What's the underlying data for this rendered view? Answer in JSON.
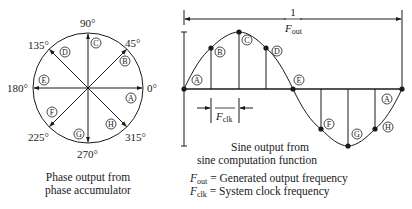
{
  "phase_wheel": {
    "angle_labels": {
      "deg0": "0°",
      "deg45": "45°",
      "deg90": "90°",
      "deg135": "135°",
      "deg180": "180°",
      "deg225": "225°",
      "deg270": "270°",
      "deg315": "315°"
    },
    "point_labels": [
      "A",
      "B",
      "C",
      "D",
      "E",
      "F",
      "G",
      "H"
    ],
    "caption_line1": "Phase output from",
    "caption_line2": "phase accumulator"
  },
  "sine_wave": {
    "period_numerator": "1",
    "period_F": "F",
    "period_sub": "out",
    "clk_F": "F",
    "clk_sub": "clk",
    "point_labels": [
      "A",
      "B",
      "C",
      "D",
      "E",
      "F",
      "G",
      "H",
      "A"
    ],
    "caption_line1": "Sine output from",
    "caption_line2": "sine computation function"
  },
  "legend": {
    "fout_F": "F",
    "fout_sub": "out",
    "fout_text": " = Generated output frequency",
    "fclk_F": "F",
    "fclk_sub": "clk",
    "fclk_text": " = System clock frequency"
  },
  "colors": {
    "stroke": "#1a1a1a",
    "background": "#ffffff"
  }
}
